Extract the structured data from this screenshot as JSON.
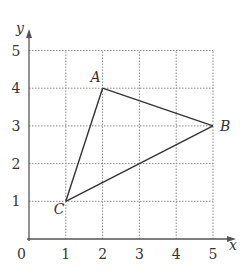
{
  "axes": {
    "x_label": "x",
    "y_label": "y",
    "origin_label": "0",
    "x_ticks": [
      "1",
      "2",
      "3",
      "4",
      "5"
    ],
    "y_ticks": [
      "1",
      "2",
      "3",
      "4",
      "5"
    ],
    "x_range": [
      0,
      5
    ],
    "y_range": [
      0,
      5
    ]
  },
  "vertices": [
    {
      "name": "A",
      "x": 2,
      "y": 4,
      "label_side": "upper-left"
    },
    {
      "name": "B",
      "x": 5,
      "y": 3,
      "label_side": "right"
    },
    {
      "name": "C",
      "x": 1,
      "y": 1,
      "label_side": "lower-left"
    }
  ],
  "edges": [
    [
      "A",
      "B"
    ],
    [
      "B",
      "C"
    ],
    [
      "C",
      "A"
    ]
  ],
  "colors": {
    "line": "#333333",
    "grid": "#8a8a8a",
    "axis": "#555555"
  }
}
